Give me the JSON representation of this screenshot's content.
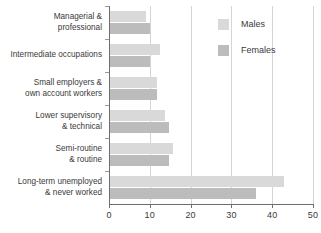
{
  "chart_data": {
    "type": "bar",
    "orientation": "horizontal",
    "title": "",
    "xlabel": "",
    "ylabel": "",
    "xlim": [
      0,
      50
    ],
    "xticks": [
      0,
      10,
      20,
      30,
      40,
      50
    ],
    "xtick_labels": [
      "0",
      "10",
      "20",
      "30",
      "40",
      "50"
    ],
    "grid": true,
    "grid_axis": "x",
    "legend_position": "top-right",
    "categories": [
      "Managerial &\nprofessional",
      "Intermediate occupations",
      "Small employers &\nown account workers",
      "Lower supervisory\n& technical",
      "Semi-routine\n& routine",
      "Long-term unemployed\n& never worked"
    ],
    "series": [
      {
        "name": "Males",
        "color": "#d9d9d9",
        "values": [
          9,
          12.5,
          11.8,
          13.7,
          15.7,
          43
        ]
      },
      {
        "name": "Females",
        "color": "#bcbcbc",
        "values": [
          10,
          10,
          11.8,
          14.7,
          14.7,
          36
        ]
      }
    ]
  },
  "legend": {
    "items": [
      {
        "label": "Males"
      },
      {
        "label": "Females"
      }
    ]
  },
  "colors": {
    "males": "#d9d9d9",
    "females": "#bcbcbc",
    "axis": "#6e6e6e",
    "grid": "#d5d5d5",
    "text": "#3a3a3a",
    "background": "#ffffff"
  }
}
